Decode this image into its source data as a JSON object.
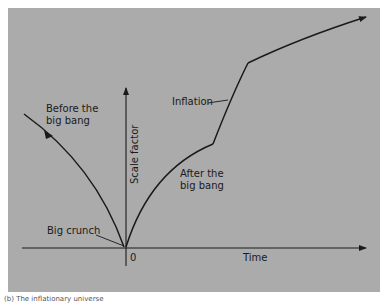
{
  "diagram": {
    "background_color": "#ababab",
    "line_color": "#1a1a1a",
    "axes": {
      "x_label": "Time",
      "y_label": "Scale factor",
      "origin_label": "0"
    },
    "annotations": {
      "before": "Before the\nbig bang",
      "after": "After the\nbig bang",
      "inflation": "Inflation",
      "big_crunch": "Big crunch"
    },
    "caption": "(b) The inflationary universe"
  }
}
